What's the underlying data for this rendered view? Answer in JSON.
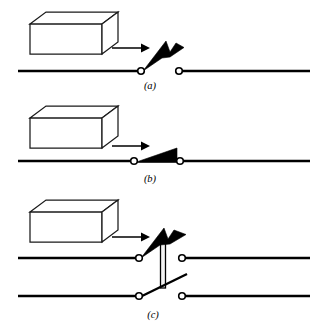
{
  "figure": {
    "background_color": "#ffffff",
    "line_color": "#000000",
    "fill_color": "#000000",
    "box_face_color": "#ffffff",
    "panels": [
      {
        "id": "a",
        "label": "(a)",
        "label_x": 150,
        "label_y": 86,
        "state": "open",
        "description": "Block approaching; switch lever raised, contacts open",
        "block": {
          "x": 30,
          "y": 12,
          "width": 72,
          "height": 30,
          "depth": 16
        },
        "arrow": {
          "x1": 112,
          "y1": 48,
          "x2": 146,
          "y2": 48,
          "direction": "right"
        },
        "rail": {
          "y": 71,
          "left_x": 18,
          "right_x": 310
        },
        "terminals": [
          {
            "name": "left-terminal",
            "cx": 142,
            "cy": 71,
            "r": 3.3
          },
          {
            "name": "right-terminal",
            "cx": 179,
            "cy": 71,
            "r": 3.3
          }
        ],
        "lever": {
          "type": "filled-wedge",
          "pivot_x": 142,
          "pivot_y": 71,
          "tip_x": 183,
          "tip_y": 48
        }
      },
      {
        "id": "b",
        "label": "(b)",
        "label_x": 150,
        "label_y": 180,
        "state": "closed",
        "description": "Block has advanced; lever depressed flat, contacts closed",
        "block": {
          "x": 30,
          "y": 106,
          "width": 72,
          "height": 30,
          "depth": 16
        },
        "arrow": {
          "x1": 112,
          "y1": 146,
          "x2": 146,
          "y2": 146,
          "direction": "right"
        },
        "rail": {
          "y": 161,
          "left_x": 18,
          "right_x": 310
        },
        "terminals": [
          {
            "name": "left-terminal",
            "cx": 134,
            "cy": 161,
            "r": 3.3
          },
          {
            "name": "right-terminal",
            "cx": 180,
            "cy": 161,
            "r": 3.3
          }
        ],
        "lever": {
          "type": "filled-triangle",
          "pivot_x": 134,
          "pivot_y": 161,
          "tip_x": 177,
          "tip_y": 148
        }
      },
      {
        "id": "c",
        "label": "(c)",
        "label_x": 153,
        "label_y": 315,
        "state": "ganged-open",
        "description": "Double-pole ganged switch linked by an insulated vertical rod; both poles open",
        "block": {
          "x": 30,
          "y": 200,
          "width": 72,
          "height": 30,
          "depth": 16
        },
        "arrow": {
          "x1": 112,
          "y1": 237,
          "x2": 146,
          "y2": 237,
          "direction": "right"
        },
        "rails": [
          {
            "name": "upper-rail",
            "y": 258,
            "left_x": 18,
            "right_x": 310
          },
          {
            "name": "lower-rail",
            "y": 296,
            "left_x": 18,
            "right_x": 310
          }
        ],
        "terminals": [
          {
            "name": "upper-left-terminal",
            "cx": 140,
            "cy": 258,
            "r": 3.3
          },
          {
            "name": "upper-right-terminal",
            "cx": 182,
            "cy": 258,
            "r": 3.3
          },
          {
            "name": "lower-left-terminal",
            "cx": 140,
            "cy": 296,
            "r": 3.3
          },
          {
            "name": "lower-right-terminal",
            "cx": 182,
            "cy": 296,
            "r": 3.3
          }
        ],
        "levers": [
          {
            "name": "upper-lever",
            "type": "filled-wedge",
            "pivot_x": 140,
            "pivot_y": 258,
            "tip_x": 186,
            "tip_y": 235
          },
          {
            "name": "lower-lever",
            "type": "thin-line",
            "pivot_x": 140,
            "pivot_y": 296,
            "tip_x": 186,
            "tip_y": 274
          }
        ],
        "linkage": {
          "name": "insulated-rod",
          "x": 163,
          "y_top": 241,
          "y_bottom": 288,
          "width": 5
        }
      }
    ]
  }
}
